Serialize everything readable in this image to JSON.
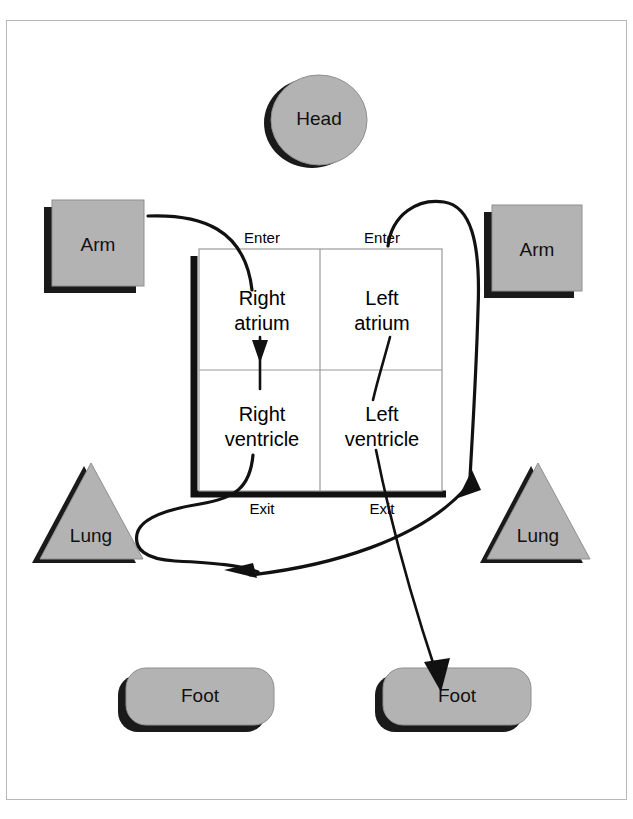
{
  "diagram": {
    "colors": {
      "body_fill": "#b3b3b3",
      "shadow": "#1a1a1a",
      "flow_line": "#111111",
      "frame_border": "#b8b8b8",
      "grid_line": "#9a9a9a",
      "page_background": "#ffffff"
    },
    "heart": {
      "chambers": [
        {
          "id": "right-atrium",
          "line1": "Right",
          "line2": "atrium"
        },
        {
          "id": "left-atrium",
          "line1": "Left",
          "line2": "atrium"
        },
        {
          "id": "right-ventricle",
          "line1": "Right",
          "line2": "ventricle"
        },
        {
          "id": "left-ventricle",
          "line1": "Left",
          "line2": "ventricle"
        }
      ],
      "ports": [
        {
          "id": "right-enter",
          "label": "Enter"
        },
        {
          "id": "left-enter",
          "label": "Enter"
        },
        {
          "id": "right-exit",
          "label": "Exit"
        },
        {
          "id": "left-exit",
          "label": "Exit"
        }
      ]
    },
    "body_parts": [
      {
        "id": "head",
        "label": "Head",
        "shape": "ellipse"
      },
      {
        "id": "arm-left",
        "label": "Arm",
        "shape": "square"
      },
      {
        "id": "arm-right",
        "label": "Arm",
        "shape": "square"
      },
      {
        "id": "lung-left",
        "label": "Lung",
        "shape": "triangle"
      },
      {
        "id": "lung-right",
        "label": "Lung",
        "shape": "triangle"
      },
      {
        "id": "foot-left",
        "label": "Foot",
        "shape": "rounded-rectangle"
      },
      {
        "id": "foot-right",
        "label": "Foot",
        "shape": "rounded-rectangle"
      }
    ],
    "flows": [
      {
        "id": "arm-left-to-right-atrium",
        "from": "arm-left",
        "to": "right-atrium"
      },
      {
        "id": "right-atrium-to-right-ventricle",
        "from": "right-atrium",
        "to": "right-ventricle"
      },
      {
        "id": "right-ventricle-to-lung-left",
        "from": "right-ventricle",
        "to": "lung-left"
      },
      {
        "id": "lung-left-to-lung-right",
        "from": "lung-left",
        "to": "lung-right"
      },
      {
        "id": "lung-right-to-left-atrium",
        "from": "lung-right",
        "to": "left-atrium"
      },
      {
        "id": "left-atrium-to-left-ventricle",
        "from": "left-atrium",
        "to": "left-ventricle"
      },
      {
        "id": "left-ventricle-to-foot-right",
        "from": "left-ventricle",
        "to": "foot-right"
      },
      {
        "id": "arm-right-to-left-atrium",
        "from": "arm-right",
        "to": "left-atrium"
      }
    ]
  }
}
